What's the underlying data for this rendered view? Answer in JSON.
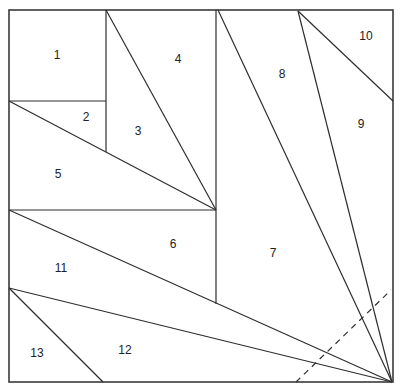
{
  "diagram": {
    "type": "quilt-block-piecing-diagram",
    "pieces": [
      {
        "id": "1",
        "label": "1",
        "x": 57,
        "y": 56
      },
      {
        "id": "2",
        "label": "2",
        "x": 86,
        "y": 118
      },
      {
        "id": "3",
        "label": "3",
        "x": 138,
        "y": 132
      },
      {
        "id": "4",
        "label": "4",
        "x": 178,
        "y": 60
      },
      {
        "id": "5",
        "label": "5",
        "x": 58,
        "y": 175
      },
      {
        "id": "6",
        "label": "6",
        "x": 173,
        "y": 245
      },
      {
        "id": "7",
        "label": "7",
        "x": 273,
        "y": 254
      },
      {
        "id": "8",
        "label": "8",
        "x": 282,
        "y": 75
      },
      {
        "id": "9",
        "label": "9",
        "x": 361,
        "y": 125
      },
      {
        "id": "10",
        "label": "10",
        "x": 366,
        "y": 37
      },
      {
        "id": "11",
        "label": "11",
        "x": 61,
        "y": 269
      },
      {
        "id": "12",
        "label": "12",
        "x": 125,
        "y": 351
      },
      {
        "id": "13",
        "label": "13",
        "x": 37,
        "y": 354
      }
    ],
    "fold_line": {
      "style": "dashed",
      "from": [
        296,
        382
      ],
      "to": [
        391,
        290
      ]
    }
  }
}
